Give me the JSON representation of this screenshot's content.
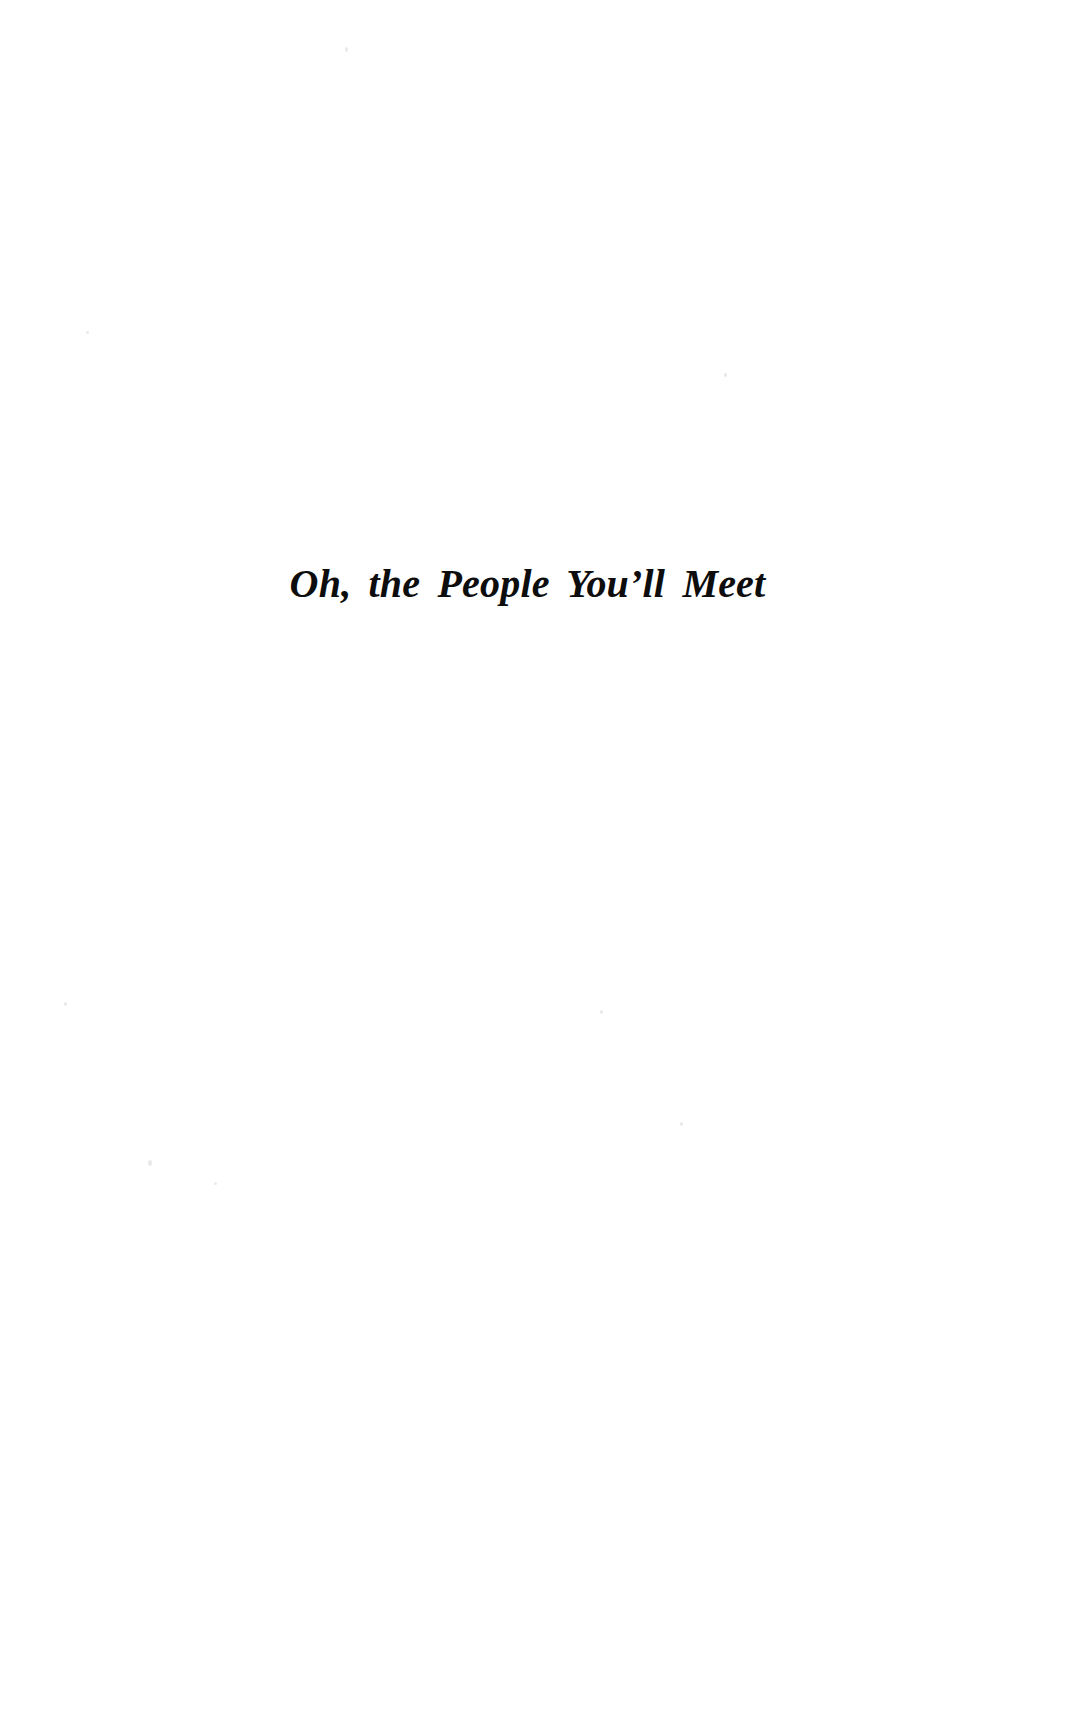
{
  "page": {
    "kind": "book-part-title-page",
    "background_color": "#ffffff",
    "text_color": "#0d0d0d",
    "width": 1083,
    "height": 1725
  },
  "part_title": {
    "text": "Oh, the People You’ll Meet"
  }
}
